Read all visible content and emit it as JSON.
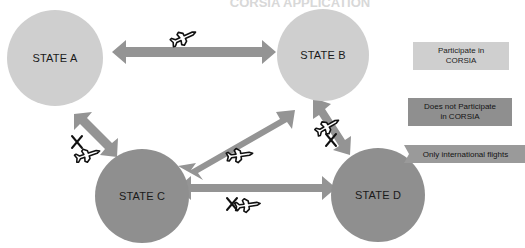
{
  "title": {
    "text": "CORSIA APPLICATION",
    "visible_partial": true
  },
  "colors": {
    "participating_fill": "#cfcfcf",
    "non_participating_fill": "#8f8f8f",
    "arrow_fill": "#949494",
    "legend_light": "#cfcfcf",
    "legend_dark": "#8f8f8f",
    "legend_banner": "#9a9a9a",
    "background": "#ffffff",
    "label_text": "#1a1a1a"
  },
  "nodes": [
    {
      "id": "a",
      "label": "STATE A",
      "participates": true,
      "cx": 55,
      "cy": 58,
      "r": 48
    },
    {
      "id": "b",
      "label": "STATE B",
      "participates": true,
      "cx": 323,
      "cy": 55,
      "r": 46
    },
    {
      "id": "c",
      "label": "STATE C",
      "participates": false,
      "cx": 142,
      "cy": 196,
      "r": 47
    },
    {
      "id": "d",
      "label": "STATE D",
      "participates": false,
      "cx": 378,
      "cy": 195,
      "r": 47
    }
  ],
  "connections": [
    {
      "id": "a-b",
      "from": "STATE A",
      "to": "STATE B",
      "bidirectional": true,
      "flights_allowed": true,
      "plane_icon": "airplane-icon",
      "crossed_out": false
    },
    {
      "id": "a-c",
      "from": "STATE A",
      "to": "STATE C",
      "bidirectional": true,
      "flights_allowed": false,
      "plane_icon": "airplane-icon",
      "crossed_out": true
    },
    {
      "id": "c-b",
      "from": "STATE C",
      "to": "STATE B",
      "bidirectional": true,
      "flights_allowed": true,
      "plane_icon": "airplane-icon",
      "crossed_out": false
    },
    {
      "id": "b-d",
      "from": "STATE B",
      "to": "STATE D",
      "bidirectional": true,
      "flights_allowed": false,
      "plane_icon": "airplane-icon",
      "crossed_out": true
    },
    {
      "id": "c-d",
      "from": "STATE C",
      "to": "STATE D",
      "bidirectional": true,
      "flights_allowed": false,
      "plane_icon": "airplane-icon",
      "crossed_out": true
    }
  ],
  "legend": {
    "items": [
      {
        "id": "participate",
        "label_line1": "Participate in",
        "label_line2": "CORSIA",
        "swatch": "light"
      },
      {
        "id": "not-participate",
        "label_line1": "Does not Participate",
        "label_line2": "in CORSIA",
        "swatch": "dark"
      },
      {
        "id": "intl-only",
        "label_line1": "Only international flights",
        "label_line2": "",
        "swatch": "banner"
      }
    ]
  },
  "cross_marks": {
    "glyph": "X"
  }
}
